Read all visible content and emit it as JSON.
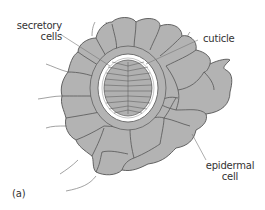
{
  "figure": {
    "panel_label": "(a)",
    "colors": {
      "cell_fill": "#b3b3b3",
      "cell_stroke": "#555555",
      "hair_stroke": "#8a8a8a",
      "cuticle": "#ffffff",
      "background": "#ffffff",
      "text": "#333333"
    }
  },
  "labels": {
    "secretory_cells": {
      "line1": "secretory",
      "line2": "cells"
    },
    "cuticle": "cuticle",
    "epidermal_cell": {
      "line1": "epidermal",
      "line2": "cell"
    }
  }
}
